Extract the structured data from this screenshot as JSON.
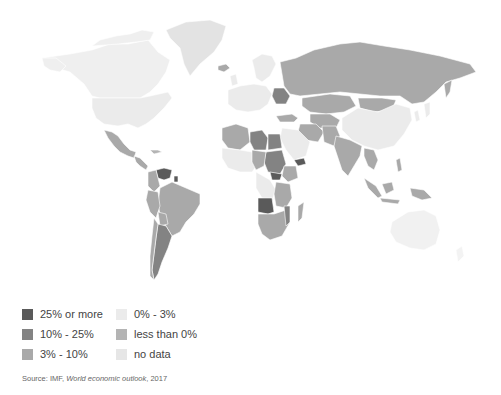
{
  "map": {
    "title": "",
    "type": "choropleth",
    "topic": "Inflation rate by country"
  },
  "legend": {
    "items": [
      {
        "label": "25% or more",
        "color": "#5a5a5a"
      },
      {
        "label": "10% - 25%",
        "color": "#838383"
      },
      {
        "label": "3% - 10%",
        "color": "#a9a9a9"
      },
      {
        "label": "0% - 3%",
        "color": "#ebebeb"
      },
      {
        "label": "less than 0%",
        "color": "#b4b4b4"
      },
      {
        "label": "no data",
        "color": "#e6e6e6"
      }
    ]
  },
  "source": {
    "prefix": "Source: IMF, ",
    "title": "World economic outlook",
    "suffix": ", 2017"
  },
  "colors": {
    "c25": "#5a5a5a",
    "c10": "#838383",
    "c3": "#a9a9a9",
    "c0": "#ebebeb",
    "neg": "#b4b4b4",
    "nodata": "#e6e6e6",
    "background": "#ffffff"
  }
}
